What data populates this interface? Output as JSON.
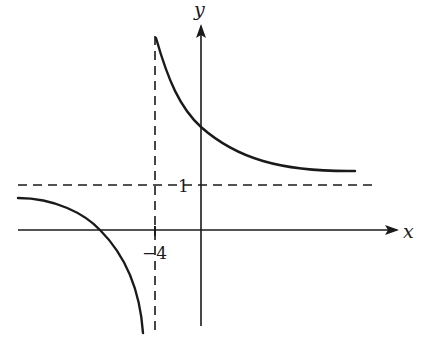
{
  "figure": {
    "type": "function-graph",
    "axes": {
      "x_label": "x",
      "y_label": "y"
    },
    "ticks": {
      "x_tick_label": "−4",
      "y_tick_label": "1"
    },
    "asymptotes": {
      "vertical": {
        "x": -4,
        "style": "dashed"
      },
      "horizontal": {
        "y": 1,
        "style": "dashed"
      }
    },
    "branches": [
      {
        "name": "right-branch",
        "domain": "x > -4",
        "behavior": "decreasing from +infinity toward y = 1"
      },
      {
        "name": "left-branch",
        "domain": "x < -4",
        "behavior": "decreasing from y = 1 toward -infinity"
      }
    ],
    "colors": {
      "ink": "#1a1a1a",
      "background": "#ffffff"
    }
  }
}
